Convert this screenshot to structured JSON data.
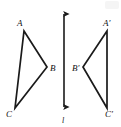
{
  "figure": {
    "width": 121,
    "height": 127,
    "background_color": "#ffffff",
    "stroke_color": "#1a1a1a"
  },
  "line_of_reflection": {
    "name": "l",
    "label": "l",
    "label_x": 62,
    "label_y": 117,
    "x": 64,
    "y_top": 8,
    "y_bottom": 113,
    "stroke_width": 1.6,
    "has_arrow_top": true,
    "has_arrow_bottom": true
  },
  "triangles": [
    {
      "id": "pre-image",
      "name": "triangle-abc",
      "stroke_width": 1.7,
      "fill": "none",
      "points": "24,31 47,67 15,108",
      "vertices": [
        {
          "key": "A",
          "label": "A",
          "x": 24,
          "y": 31,
          "label_x": 17,
          "label_y": 19
        },
        {
          "key": "B",
          "label": "B",
          "x": 47,
          "y": 67,
          "label_x": 50,
          "label_y": 64
        },
        {
          "key": "C",
          "label": "C",
          "x": 15,
          "y": 108,
          "label_x": 6,
          "label_y": 110
        }
      ]
    },
    {
      "id": "image",
      "name": "triangle-a-prime-b-prime-c-prime",
      "stroke_width": 1.7,
      "fill": "none",
      "points": "107,31 83,67 107,108",
      "vertices": [
        {
          "key": "A'",
          "label": "A′",
          "x": 107,
          "y": 31,
          "label_x": 103,
          "label_y": 19
        },
        {
          "key": "B'",
          "label": "B′",
          "x": 83,
          "y": 67,
          "label_x": 72,
          "label_y": 64
        },
        {
          "key": "C'",
          "label": "C′",
          "x": 107,
          "y": 108,
          "label_x": 105,
          "label_y": 110
        }
      ]
    }
  ]
}
